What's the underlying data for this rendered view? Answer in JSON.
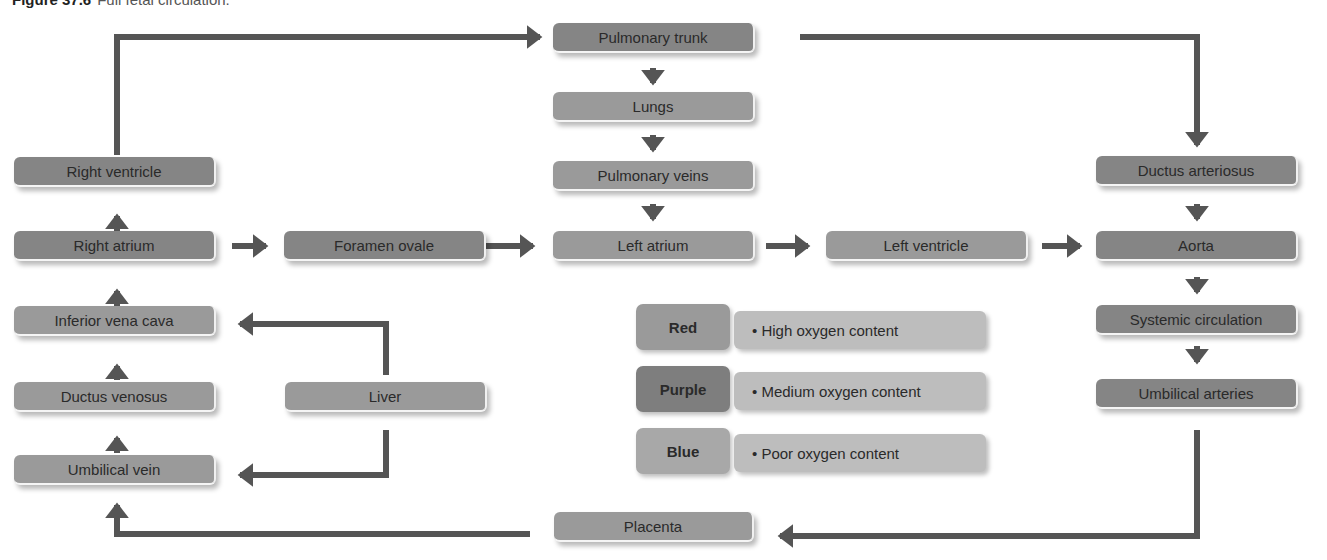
{
  "figure": {
    "label": "Figure 37.6",
    "caption": "Full fetal circulation."
  },
  "nodes": {
    "pulmonary_trunk": "Pulmonary trunk",
    "lungs": "Lungs",
    "pulmonary_veins": "Pulmonary veins",
    "left_atrium": "Left atrium",
    "left_ventricle": "Left ventricle",
    "right_ventricle": "Right ventricle",
    "right_atrium": "Right atrium",
    "foramen_ovale": "Foramen ovale",
    "inferior_vena_cava": "Inferior vena cava",
    "ductus_venosus": "Ductus venosus",
    "umbilical_vein": "Umbilical vein",
    "liver": "Liver",
    "ductus_arteriosus": "Ductus arteriosus",
    "aorta": "Aorta",
    "systemic_circulation": "Systemic circulation",
    "umbilical_arteries": "Umbilical arteries",
    "placenta": "Placenta"
  },
  "legend": [
    {
      "key": "Red",
      "description": "• High oxygen content",
      "color": "#9a9a9a"
    },
    {
      "key": "Purple",
      "description": "• Medium oxygen content",
      "color": "#858585"
    },
    {
      "key": "Blue",
      "description": "• Poor oxygen content",
      "color": "#a8a8a8"
    }
  ],
  "colors": {
    "arrow": "#555555",
    "red_box": "#9a9a9a",
    "purple_box": "#858585",
    "blue_box": "#a8a8a8",
    "legend_desc": "#bdbdbd"
  }
}
